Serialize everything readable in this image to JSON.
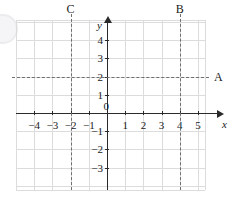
{
  "figure": {
    "type": "coordinate-plane",
    "title": "",
    "background_color": "#ffffff",
    "grid_color": "#dcdcdc",
    "axis_color": "#2a2a2a",
    "dash_color": "#6f6f6f"
  },
  "axes": {
    "x_name": "x",
    "y_name": "y",
    "origin_label": "0",
    "x_ticks": [
      {
        "value": -4,
        "label": "−4"
      },
      {
        "value": -3,
        "label": "−3"
      },
      {
        "value": -2,
        "label": "−2"
      },
      {
        "value": -1,
        "label": "−1"
      },
      {
        "value": 1,
        "label": "1"
      },
      {
        "value": 2,
        "label": "2"
      },
      {
        "value": 3,
        "label": "3"
      },
      {
        "value": 4,
        "label": "4"
      },
      {
        "value": 5,
        "label": "5"
      }
    ],
    "y_ticks": [
      {
        "value": 4,
        "label": "4"
      },
      {
        "value": 3,
        "label": "3"
      },
      {
        "value": 2,
        "label": "2"
      },
      {
        "value": 1,
        "label": "1"
      },
      {
        "value": -1,
        "label": "−1"
      },
      {
        "value": -2,
        "label": "−2"
      },
      {
        "value": -3,
        "label": "−3"
      }
    ],
    "x_range": [
      -5,
      6
    ],
    "y_range": [
      -4,
      5
    ]
  },
  "lines": [
    {
      "label": "A",
      "orientation": "horizontal",
      "equation_value": 2,
      "style": "dashed",
      "label_position": "right"
    },
    {
      "label": "B",
      "orientation": "vertical",
      "equation_value": 4,
      "style": "dashed",
      "label_position": "top"
    },
    {
      "label": "C",
      "orientation": "vertical",
      "equation_value": -2,
      "style": "dashed",
      "label_position": "top"
    }
  ],
  "chart_data": {
    "type": "line",
    "title": "",
    "xlabel": "x",
    "ylabel": "y",
    "xlim": [
      -5,
      6
    ],
    "ylim": [
      -4,
      5
    ],
    "grid": true,
    "legend": "none",
    "series": [
      {
        "name": "A",
        "kind": "horizontal-line",
        "y": 2,
        "style": "dashed"
      },
      {
        "name": "B",
        "kind": "vertical-line",
        "x": 4,
        "style": "dashed"
      },
      {
        "name": "C",
        "kind": "vertical-line",
        "x": -2,
        "style": "dashed"
      }
    ]
  }
}
